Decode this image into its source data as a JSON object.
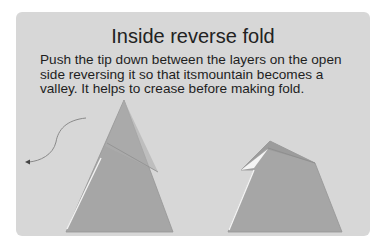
{
  "title": "Inside reverse fold",
  "instructions": {
    "line1": "Push the tip down between the layers on the open",
    "line2": "side reversing it so that itsmountain becomes a",
    "line3": "valley. It helps to crease before making fold."
  },
  "colors": {
    "card_background": "#d7d7d7",
    "paper_fill": "#a6a6a6",
    "paper_edge": "#8f8f8f",
    "highlight": "#f4f4f4",
    "arrow": "#777777"
  },
  "figures": [
    {
      "name": "before",
      "description": "Tall triangle with crease line and curved arrow"
    },
    {
      "name": "after",
      "description": "Triangle with tip reversed inside"
    }
  ]
}
